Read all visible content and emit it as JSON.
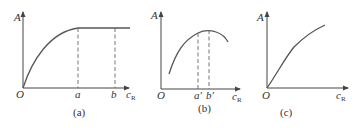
{
  "panels": [
    {
      "id": "a",
      "caption": "(a)",
      "y_label": "A",
      "x_label_main": "c",
      "x_label_sub": "R",
      "origin_label": "O",
      "markers": [
        {
          "label": "a"
        },
        {
          "label": "b"
        }
      ],
      "description": "A rises with c_R then plateaus beyond a; flat region from a to b"
    },
    {
      "id": "b",
      "caption": "(b)",
      "y_label": "A",
      "x_label_main": "c",
      "x_label_sub": "R",
      "origin_label": "O",
      "markers": [
        {
          "label": "a'"
        },
        {
          "label": "b'"
        }
      ],
      "description": "A rises to a maximum between a' and b' then decreases"
    },
    {
      "id": "c",
      "caption": "(c)",
      "y_label": "A",
      "x_label_main": "c",
      "x_label_sub": "R",
      "origin_label": "O",
      "markers": [],
      "description": "A increases monotonically with c_R (slightly concave)"
    }
  ]
}
